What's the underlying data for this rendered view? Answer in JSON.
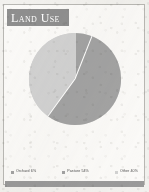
{
  "card": {
    "title": "Land Use",
    "banner_color": "#8f8f8f",
    "background_color": "#f2f1ee",
    "footer_color": "#9a9a9a"
  },
  "chart_data": {
    "type": "pie",
    "title": "Land Use",
    "xlabel": "",
    "ylabel": "",
    "legend_position": "bottom",
    "grid": false,
    "start_angle_deg": 0,
    "direction": "clockwise",
    "categories": [
      "Orchard",
      "Pasture",
      "Other"
    ],
    "values": [
      6,
      54,
      40
    ],
    "unit": "%",
    "colors": [
      "#a3a3a3",
      "#a3a3a3",
      "#d2d2d2"
    ],
    "slice_separator_color": "#ffffff",
    "labels": [
      "Orchard 6%",
      "Pasture 54%",
      "Other 40%"
    ],
    "slices": [
      {
        "name": "Orchard",
        "value": 6,
        "label": "Orchard 6%",
        "color": "#a3a3a3"
      },
      {
        "name": "Pasture",
        "value": 54,
        "label": "Pasture 54%",
        "color": "#a3a3a3"
      },
      {
        "name": "Other",
        "value": 40,
        "label": "Other 40%",
        "color": "#d2d2d2"
      }
    ]
  }
}
